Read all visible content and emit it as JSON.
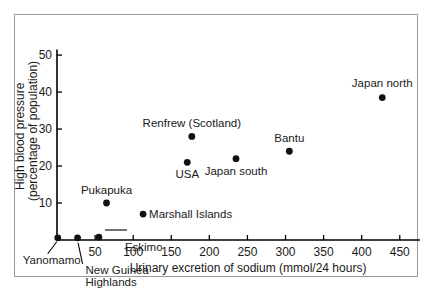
{
  "chart_data": {
    "type": "scatter",
    "title": "",
    "xlabel": "Urinary excretion of sodium (mmol/24 hours)",
    "ylabel_line1": "High blood pressure",
    "ylabel_line2": "(percentage of population)",
    "xlim": [
      0,
      470
    ],
    "ylim": [
      0,
      53
    ],
    "xticks": [
      50,
      100,
      150,
      200,
      250,
      300,
      350,
      400,
      450
    ],
    "xticklabels": [
      "50",
      "100",
      "150",
      "200",
      "250",
      "300",
      "350",
      "400",
      "450"
    ],
    "yticks": [
      10,
      20,
      30,
      40,
      50
    ],
    "yticklabels": [
      "10",
      "20",
      "30",
      "40",
      "50"
    ],
    "grid": false,
    "legend": "none",
    "points": [
      {
        "label": "Yanomamo",
        "x": 1,
        "y": 0.6,
        "label_dx": -6,
        "label_dy": 26,
        "anchor": "middle",
        "leader": true
      },
      {
        "label": "New Guinea Highlands",
        "x": 27,
        "y": 0.6,
        "label_dx": 8,
        "label_dy": 36,
        "anchor": "start",
        "leader": true
      },
      {
        "label": "Eskimo",
        "x": 55,
        "y": 0.8,
        "label_dx": 26,
        "label_dy": 14,
        "anchor": "start",
        "leader": false
      },
      {
        "label": "Pukapuka",
        "x": 65,
        "y": 10.0,
        "label_dx": 0,
        "label_dy": -9,
        "anchor": "middle",
        "leader": false
      },
      {
        "label": "Marshall Islands",
        "x": 113,
        "y": 7.0,
        "label_dx": 6,
        "label_dy": 4,
        "anchor": "start",
        "leader": false
      },
      {
        "label": "Renfrew (Scotland)",
        "x": 177,
        "y": 28.0,
        "label_dx": 0,
        "label_dy": -9,
        "anchor": "middle",
        "leader": false
      },
      {
        "label": "USA",
        "x": 171,
        "y": 21.0,
        "label_dx": 0,
        "label_dy": 16,
        "anchor": "middle",
        "leader": false
      },
      {
        "label": "Japan south",
        "x": 235,
        "y": 22.0,
        "label_dx": 0,
        "label_dy": 16,
        "anchor": "middle",
        "leader": false
      },
      {
        "label": "Bantu",
        "x": 305,
        "y": 24.0,
        "label_dx": 0,
        "label_dy": -9,
        "anchor": "middle",
        "leader": false
      },
      {
        "label": "Japan north",
        "x": 427,
        "y": 38.5,
        "label_dx": 0,
        "label_dy": -11,
        "anchor": "middle",
        "leader": false
      }
    ]
  }
}
